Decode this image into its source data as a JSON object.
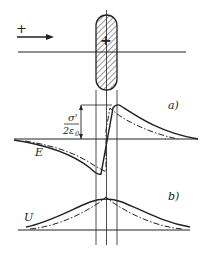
{
  "figure": {
    "charge_sign_left": "+",
    "charge_sign_body": "+",
    "panel_a_label": "a)",
    "panel_b_label": "b)",
    "field_label": "E",
    "potential_label": "U",
    "jump_numerator": "σ'",
    "jump_denominator": "2ε",
    "jump_denominator_sub": "0"
  },
  "colors": {
    "ink": "#222222",
    "background": "#ffffff"
  }
}
